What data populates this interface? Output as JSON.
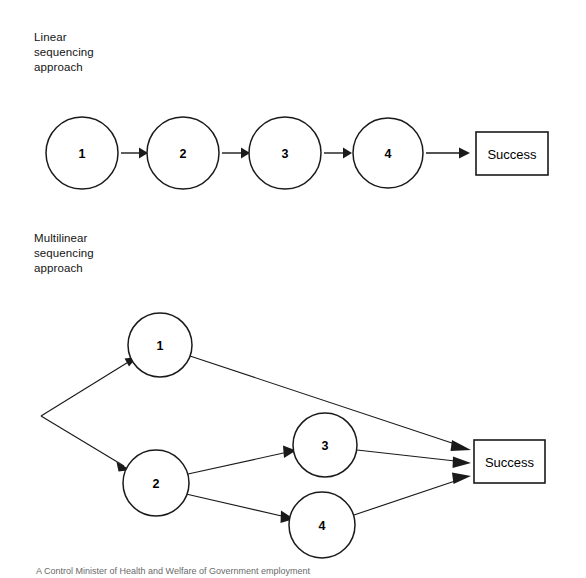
{
  "figure": {
    "background_color": "#ffffff",
    "ink_color": "#1a1a1a",
    "caption_partial": "A Control Minister of Health and Welfare of Government employment"
  },
  "sections": [
    {
      "id": "linear",
      "label": "Linear\nsequencing\napproach",
      "type": "linear-chain"
    },
    {
      "id": "multilinear",
      "label": "Multilinear\nsequencing\napproach",
      "type": "branching-network"
    }
  ],
  "linear_diagram": {
    "nodes": [
      {
        "id": "n1",
        "label": "1",
        "cx": 82,
        "cy": 153,
        "r": 36
      },
      {
        "id": "n2",
        "label": "2",
        "cx": 183,
        "cy": 153,
        "r": 36
      },
      {
        "id": "n3",
        "label": "3",
        "cx": 285,
        "cy": 153,
        "r": 36
      },
      {
        "id": "n4",
        "label": "4",
        "cx": 388,
        "cy": 153,
        "r": 35
      }
    ],
    "terminal": {
      "id": "success-top",
      "label": "Success",
      "x": 476,
      "y": 132,
      "width": 72,
      "height": 43
    },
    "edges": [
      {
        "from": "n1",
        "to": "n2"
      },
      {
        "from": "n2",
        "to": "n3"
      },
      {
        "from": "n3",
        "to": "n4"
      },
      {
        "from": "n4",
        "to": "success-top"
      }
    ]
  },
  "multilinear_diagram": {
    "origin": {
      "x": 41,
      "y": 416
    },
    "nodes": [
      {
        "id": "m1",
        "label": "1",
        "cx": 160,
        "cy": 345,
        "r": 32
      },
      {
        "id": "m2",
        "label": "2",
        "cx": 156,
        "cy": 483,
        "r": 33
      },
      {
        "id": "m3",
        "label": "3",
        "cx": 325,
        "cy": 445,
        "r": 32
      },
      {
        "id": "m4",
        "label": "4",
        "cx": 322,
        "cy": 525,
        "r": 33
      }
    ],
    "terminal": {
      "id": "success-bottom",
      "label": "Success",
      "x": 474,
      "y": 440,
      "width": 71,
      "height": 43
    },
    "edges": [
      {
        "from": "origin",
        "to": "m1"
      },
      {
        "from": "origin",
        "to": "m2"
      },
      {
        "from": "m1",
        "to": "success-bottom"
      },
      {
        "from": "m2",
        "to": "m3"
      },
      {
        "from": "m2",
        "to": "m4"
      },
      {
        "from": "m3",
        "to": "success-bottom"
      },
      {
        "from": "m4",
        "to": "success-bottom"
      }
    ]
  }
}
